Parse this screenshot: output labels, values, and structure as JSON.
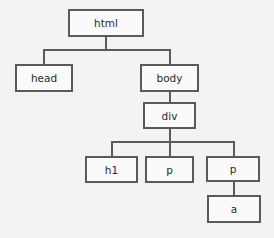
{
  "diagram": {
    "type": "tree",
    "title": "",
    "nodes": {
      "html": {
        "label": "html"
      },
      "head": {
        "label": "head"
      },
      "body": {
        "label": "body"
      },
      "div": {
        "label": "div"
      },
      "h1": {
        "label": "h1"
      },
      "p1": {
        "label": "p"
      },
      "p2": {
        "label": "p"
      },
      "a": {
        "label": "a"
      }
    },
    "edges": [
      {
        "from": "html",
        "to": "head"
      },
      {
        "from": "html",
        "to": "body"
      },
      {
        "from": "body",
        "to": "div"
      },
      {
        "from": "div",
        "to": "h1"
      },
      {
        "from": "div",
        "to": "p1"
      },
      {
        "from": "div",
        "to": "p2"
      },
      {
        "from": "p2",
        "to": "a"
      }
    ],
    "colors": {
      "background": "#f3f3f3",
      "line": "#5a5a5a",
      "box_fill": "#fafafa",
      "text": "#2a2a2a"
    }
  }
}
